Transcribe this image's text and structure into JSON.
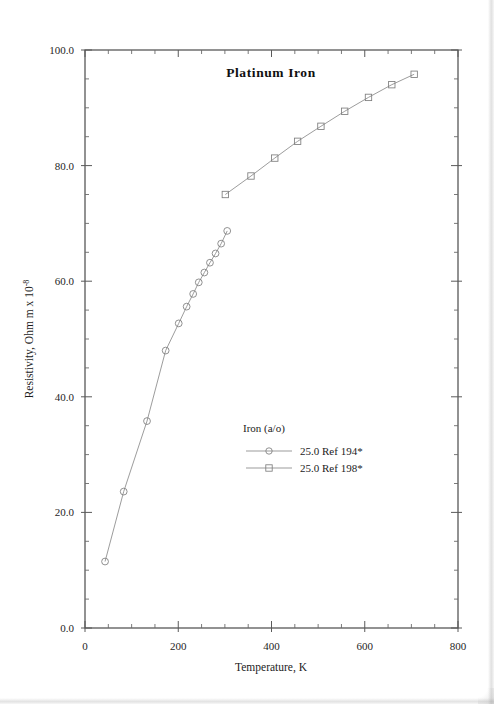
{
  "figure": {
    "title": "Platinum  Iron",
    "background_color": "#ffffff",
    "line_color": "#8a8a8a",
    "axis_color": "#3a3a3a",
    "text_color": "#1c1c1c"
  },
  "axes": {
    "x": {
      "title": "Temperature,  K",
      "tick_labels": [
        "0",
        "200",
        "400",
        "600",
        "800"
      ],
      "tick_values": [
        0,
        200,
        400,
        600,
        800
      ],
      "min": 0,
      "max": 800,
      "minor_tick_step": 50
    },
    "y": {
      "title_main": "Resistivity, Ohm m x 10",
      "title_exponent": "-8",
      "tick_labels": [
        "0.0",
        "20.0",
        "40.0",
        "60.0",
        "80.0",
        "100.0"
      ],
      "tick_values": [
        0,
        20,
        40,
        60,
        80,
        100
      ],
      "min": 0,
      "max": 100,
      "minor_tick_step": 5
    }
  },
  "legend": {
    "header": "Iron (a/o)",
    "entries": [
      {
        "marker": "circle",
        "label": "25.0 Ref 194*"
      },
      {
        "marker": "square",
        "label": "25.0 Ref 198*"
      }
    ]
  },
  "chart_data": {
    "type": "line",
    "title": "Platinum  Iron",
    "xlabel": "Temperature,  K",
    "ylabel": "Resistivity, Ohm m x 10^-8",
    "xlim": [
      0,
      800
    ],
    "ylim": [
      0,
      100
    ],
    "grid": false,
    "legend_position": "center",
    "legend_title": "Iron (a/o)",
    "series": [
      {
        "name": "25.0 Ref 194*",
        "marker": "circle",
        "x": [
          43,
          83,
          133,
          173,
          201,
          218,
          232,
          244,
          256,
          268,
          280,
          292,
          305
        ],
        "y": [
          11.5,
          23.6,
          35.8,
          48.0,
          52.7,
          55.6,
          57.8,
          59.8,
          61.5,
          63.2,
          64.8,
          66.5,
          68.7
        ]
      },
      {
        "name": "25.0 Ref 198*",
        "marker": "square",
        "x": [
          301,
          356,
          407,
          456,
          506,
          557,
          608,
          658,
          706
        ],
        "y": [
          75.0,
          78.2,
          81.3,
          84.2,
          86.8,
          89.4,
          91.8,
          94.0,
          95.8
        ]
      }
    ]
  }
}
